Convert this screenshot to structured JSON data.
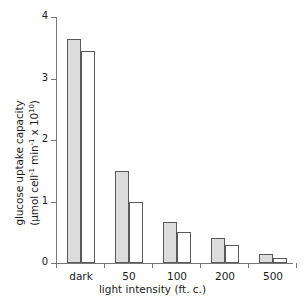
{
  "chart_data": {
    "type": "bar",
    "title": "",
    "categories": [
      "dark",
      "50",
      "100",
      "200",
      "500"
    ],
    "series": [
      {
        "name": "series-1-shaded",
        "values": [
          3.64,
          1.5,
          0.67,
          0.41,
          0.15
        ]
      },
      {
        "name": "series-2-open",
        "values": [
          3.45,
          0.99,
          0.51,
          0.29,
          0.08
        ]
      }
    ],
    "xlabel": "light intensity (ft. c.)",
    "ylabel_line1": "glucose uptake capacity",
    "ylabel_line2_prefix": "(µmol cell",
    "ylabel_line2_sup1": "-1",
    "ylabel_line2_mid": " min",
    "ylabel_line2_sup2": "-1",
    "ylabel_line2_suffix": " x 10",
    "ylabel_line2_sup3": "10",
    "ylabel_line2_end": ")",
    "ylim": [
      0,
      4
    ],
    "yticks": [
      "0",
      "1",
      "2",
      "3",
      "4"
    ],
    "ytick_values": [
      0,
      1,
      2,
      3,
      4
    ],
    "grid": false,
    "legend": "none",
    "colors": {
      "series1_fill": "#dcdcdc",
      "series2_fill": "#ffffff",
      "bar_border": "#5a5a5a",
      "axis": "#777777",
      "text": "#1a1a1a",
      "background": "#ffffff"
    }
  },
  "watermark": {
    "text": ""
  }
}
